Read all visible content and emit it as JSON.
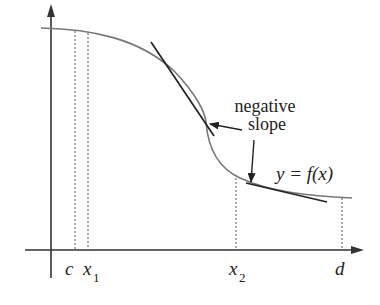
{
  "figure": {
    "curve_label": "y = f(x)",
    "annotation": {
      "line1": "negative",
      "line2": "slope"
    },
    "x_axis_labels": {
      "c": "c",
      "x1_base": "x",
      "x1_sub": "1",
      "x2_base": "x",
      "x2_sub": "2",
      "d": "d"
    },
    "colors": {
      "axis": "#333333",
      "curve": "#777777",
      "tangent": "#222222",
      "dashed": "#555555",
      "text": "#222222"
    }
  }
}
